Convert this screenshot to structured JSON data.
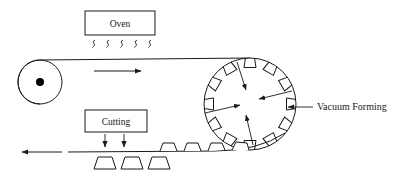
{
  "diagram": {
    "background_color": "#ffffff",
    "line_color": "#1a1a1a",
    "dot_color": "#000000",
    "width": 409,
    "height": 178,
    "labels": {
      "oven": "Oven",
      "cutting": "Cutting",
      "vacuum_forming": "Vacuum Forming"
    },
    "oven_box": {
      "label": "Oven",
      "x": 85,
      "y": 11,
      "width": 70,
      "height": 24
    },
    "cutting_box": {
      "label": "Cutting",
      "x": 85,
      "y": 110,
      "width": 62,
      "height": 22
    },
    "heat_waves": {
      "count": 5,
      "symbol": "heat-squiggle",
      "start_x": 92,
      "spacing": 14,
      "y": 40
    },
    "roller": {
      "name": "idler-roller",
      "center_x": 40,
      "center_y": 82,
      "radius": 22,
      "hub_radius": 4
    },
    "drum": {
      "name": "vacuum-forming-drum",
      "center_x": 250,
      "center_y": 104,
      "radius": 46,
      "notch_count": 12,
      "notch_shape": "trapezoid"
    },
    "belt": {
      "top_y": 60,
      "bottom_y": 152,
      "direction_top": "right",
      "direction_bottom": "left"
    },
    "arrows": {
      "top_belt_direction": "right",
      "bottom_belt_direction": "left",
      "cutting_blades": 2,
      "vacuum_inward": 4
    },
    "formed_parts_on_belt": {
      "count": 4,
      "shape": "trapezoid"
    },
    "cut_parts": {
      "count": 3,
      "shape": "trapezoid"
    }
  }
}
